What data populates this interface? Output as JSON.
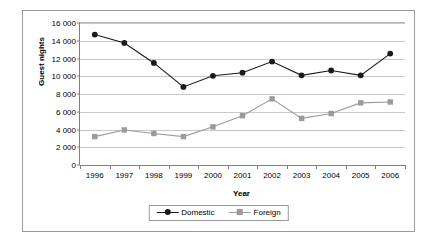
{
  "chart_data": {
    "type": "line",
    "title": "",
    "xlabel": "Year",
    "ylabel": "Guest nights",
    "categories": [
      "1996",
      "1997",
      "1998",
      "1999",
      "2000",
      "2001",
      "2002",
      "2003",
      "2004",
      "2005",
      "2006"
    ],
    "ylim": [
      0,
      16000
    ],
    "ytick_values": [
      0,
      2000,
      4000,
      6000,
      8000,
      10000,
      12000,
      14000,
      16000
    ],
    "ytick_labels": [
      "0",
      "2 000",
      "4 000",
      "6 000",
      "8 000",
      "10 000",
      "12 000",
      "14 000",
      "16 000"
    ],
    "grid": true,
    "legend_position": "bottom",
    "series": [
      {
        "name": "Domestic",
        "color": "#1a1a1a",
        "marker": "circle",
        "values": [
          14700,
          13750,
          11500,
          8800,
          10050,
          10400,
          11650,
          10100,
          10650,
          10100,
          12550
        ]
      },
      {
        "name": "Foreign",
        "color": "#9b9b9b",
        "marker": "square",
        "values": [
          3200,
          3950,
          3550,
          3200,
          4300,
          5550,
          7450,
          5250,
          5800,
          7000,
          7100
        ]
      }
    ]
  },
  "colors": {
    "frame_border": "#9a9a9a",
    "gridline": "#c8c8c8",
    "axis": "#808080",
    "domestic": "#1a1a1a",
    "foreign": "#9b9b9b",
    "background": "#ffffff"
  },
  "legend": {
    "entries": [
      {
        "label": "Domestic"
      },
      {
        "label": "Foreign"
      }
    ]
  }
}
